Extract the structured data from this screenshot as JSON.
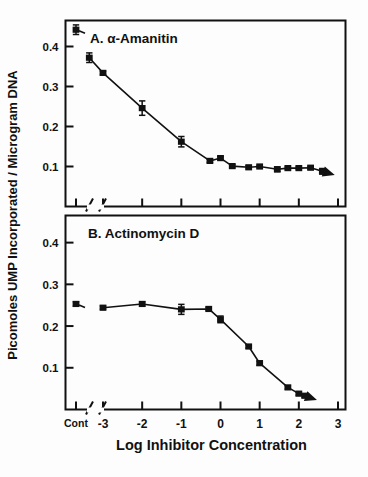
{
  "figure": {
    "background_color": "#fdfdfd",
    "ink_color": "#111111",
    "ylabel": "Picomoles UMP Incorporated / Microgram DNA",
    "xlabel": "Log  Inhibitor  Concentration",
    "xticklabels": [
      "Cont",
      "-3",
      "-2",
      "-1",
      "0",
      "1",
      "2",
      "3"
    ],
    "yticklabels": [
      "0.4",
      "0.3",
      "0.2",
      "0.1"
    ],
    "panel_a_title": "A.  α-Amanitin",
    "panel_b_title": "B.  Actinomycin  D"
  },
  "chart_data": [
    {
      "type": "line",
      "panel": "A",
      "title": "A.  α-Amanitin",
      "xlabel": "Log  Inhibitor  Concentration",
      "ylabel": "Picomoles UMP Incorporated / Microgram DNA",
      "xlim": [
        -3.6,
        3.0
      ],
      "ylim": [
        0.0,
        0.465
      ],
      "xticks": [
        -3,
        -2,
        -1,
        0,
        1,
        2,
        3
      ],
      "xticklabels": [
        "-3",
        "-2",
        "-1",
        "0",
        "1",
        "2",
        "3"
      ],
      "yticks": [
        0.1,
        0.2,
        0.3,
        0.4
      ],
      "yticklabels": [
        "0.1",
        "0.2",
        "0.3",
        "0.4"
      ],
      "grid": false,
      "legend": null,
      "axis_break_after_control": true,
      "control_point": {
        "x_label": "Cont",
        "y": 0.442,
        "yerr": 0.012
      },
      "x": [
        -3.35,
        -3.0,
        -2.0,
        -1.0,
        -0.27,
        0.0,
        0.3,
        0.72,
        1.0,
        1.45,
        1.72,
        2.0,
        2.3,
        2.6
      ],
      "y": [
        0.372,
        0.334,
        0.246,
        0.162,
        0.114,
        0.121,
        0.101,
        0.098,
        0.1,
        0.093,
        0.096,
        0.096,
        0.097,
        0.088
      ],
      "yerr": [
        0.012,
        0.004,
        0.018,
        0.013,
        0.004,
        0.004,
        0.004,
        0.004,
        0.003,
        0.006,
        0.003,
        0.003,
        0.003,
        0.007
      ],
      "series": [
        {
          "name": "α-Amanitin",
          "marker": "square",
          "values": [
            0.372,
            0.334,
            0.246,
            0.162,
            0.114,
            0.121,
            0.101,
            0.098,
            0.1,
            0.093,
            0.096,
            0.096,
            0.097,
            0.088
          ]
        }
      ],
      "end_arrow": true
    },
    {
      "type": "line",
      "panel": "B",
      "title": "B.  Actinomycin  D",
      "xlabel": "Log  Inhibitor  Concentration",
      "ylabel": "Picomoles UMP Incorporated / Microgram DNA",
      "xlim": [
        -3.6,
        3.0
      ],
      "ylim": [
        0.0,
        0.465
      ],
      "xticks": [
        -3,
        -2,
        -1,
        0,
        1,
        2,
        3
      ],
      "xticklabels": [
        "-3",
        "-2",
        "-1",
        "0",
        "1",
        "2",
        "3"
      ],
      "yticks": [
        0.1,
        0.2,
        0.3,
        0.4
      ],
      "yticklabels": [
        "0.1",
        "0.2",
        "0.3",
        "0.4"
      ],
      "grid": false,
      "legend": null,
      "axis_break_after_control": true,
      "control_point": {
        "x_label": "Cont",
        "y": 0.253,
        "yerr": 0.005
      },
      "x": [
        -3.0,
        -2.0,
        -1.0,
        -0.3,
        0.0,
        0.72,
        1.0,
        1.72,
        2.0,
        2.15
      ],
      "y": [
        0.244,
        0.253,
        0.24,
        0.241,
        0.216,
        0.151,
        0.111,
        0.053,
        0.038,
        0.033
      ],
      "yerr": [
        0.004,
        0.005,
        0.012,
        0.004,
        0.008,
        0.004,
        0.005,
        0.004,
        0.004,
        0.004
      ],
      "series": [
        {
          "name": "Actinomycin D",
          "marker": "square",
          "values": [
            0.244,
            0.253,
            0.24,
            0.241,
            0.216,
            0.151,
            0.111,
            0.053,
            0.038,
            0.033
          ]
        }
      ],
      "end_arrow": true
    }
  ]
}
